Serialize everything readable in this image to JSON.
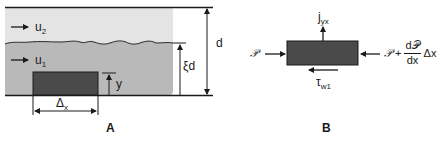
{
  "panels": [
    {
      "id": "A",
      "label": "A",
      "layers": [
        {
          "name": "upper-fluid",
          "velocity_label": "u",
          "velocity_sub": "2",
          "color": "#e4e4e4"
        },
        {
          "name": "lower-fluid",
          "velocity_label": "u",
          "velocity_sub": "1",
          "color": "#b9b9b9"
        }
      ],
      "element_color": "#4a4a4a",
      "dimensions": {
        "total_height": "d",
        "lower_layer_height_prefix": "ξ",
        "lower_layer_height_var": "d",
        "element_height": "y",
        "element_width_prefix": "Δ",
        "element_width_sub": "x"
      }
    },
    {
      "id": "B",
      "label": "B",
      "element_color": "#4a4a4a",
      "forces": {
        "top_flux": "j",
        "top_flux_sub": "yx",
        "left_pressure": "𝒫",
        "right_pressure": "𝒫",
        "right_plus": "+",
        "right_num": "d𝒫",
        "right_den": "dx",
        "right_tail": "Δx",
        "bottom_shear": "τ",
        "bottom_shear_sub": "w1"
      }
    }
  ]
}
